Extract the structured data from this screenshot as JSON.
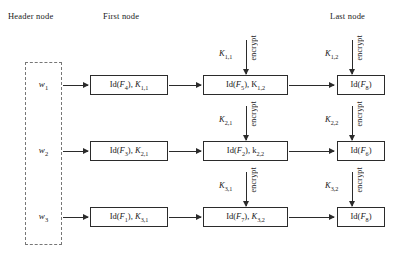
{
  "diagram": {
    "column_titles": {
      "header": "Header node",
      "first": "First node",
      "last": "Last node"
    },
    "header_node": {
      "weights": [
        "w1",
        "w2",
        "w3"
      ],
      "weight_labels": [
        "w",
        "w",
        "w"
      ],
      "weight_subs": [
        "1",
        "2",
        "3"
      ]
    },
    "rows": [
      {
        "weight": "w",
        "weight_sub": "1",
        "first": {
          "id_label": "Id(",
          "id_sym": "F",
          "id_sub": "4",
          "id_close": "), ",
          "key": "K",
          "key_sub": "1,1"
        },
        "middle": {
          "id_label": "Id(",
          "id_sym": "F",
          "id_sub": "5",
          "id_close": "), ",
          "key": "K",
          "key_sub": "1,2"
        },
        "last": {
          "id_label": "Id(",
          "id_sym": "F",
          "id_sub": "8",
          "id_close": ")",
          "key": "",
          "key_sub": ""
        },
        "encrypt_mid": {
          "text": "encrypt",
          "key": "K",
          "key_sub": "1,1"
        },
        "encrypt_last": {
          "text": "encrypt",
          "key": "K",
          "key_sub": "1,2"
        }
      },
      {
        "weight": "w",
        "weight_sub": "2",
        "first": {
          "id_label": "Id(",
          "id_sym": "F",
          "id_sub": "3",
          "id_close": "), ",
          "key": "K",
          "key_sub": "2,1"
        },
        "middle": {
          "id_label": "Id(",
          "id_sym": "F",
          "id_sub": "2",
          "id_close": "), ",
          "key": "k",
          "key_sub": "2,2"
        },
        "last": {
          "id_label": "Id(",
          "id_sym": "F",
          "id_sub": "6",
          "id_close": ")",
          "key": "",
          "key_sub": ""
        },
        "encrypt_mid": {
          "text": "encrypt",
          "key": "K",
          "key_sub": "2,1"
        },
        "encrypt_last": {
          "text": "encrypt",
          "key": "K",
          "key_sub": "2,2"
        }
      },
      {
        "weight": "w",
        "weight_sub": "3",
        "first": {
          "id_label": "Id(",
          "id_sym": "F",
          "id_sub": "1",
          "id_close": "), ",
          "key": "K",
          "key_sub": "3,1"
        },
        "middle": {
          "id_label": "Id(",
          "id_sym": "F",
          "id_sub": "7",
          "id_close": "), ",
          "key": "K",
          "key_sub": "3,2"
        },
        "last": {
          "id_label": "Id(",
          "id_sym": "F",
          "id_sub": "8",
          "id_close": ")",
          "key": "",
          "key_sub": ""
        },
        "encrypt_mid": {
          "text": "encrypt",
          "key": "K",
          "key_sub": "3,1"
        },
        "encrypt_last": {
          "text": "encrypt",
          "key": "K",
          "key_sub": "3,2"
        }
      }
    ],
    "colors": {
      "stroke": "#2b2b2b",
      "dashed_stroke": "#777777",
      "background": "#ffffff",
      "text": "#1a1a1a"
    }
  }
}
